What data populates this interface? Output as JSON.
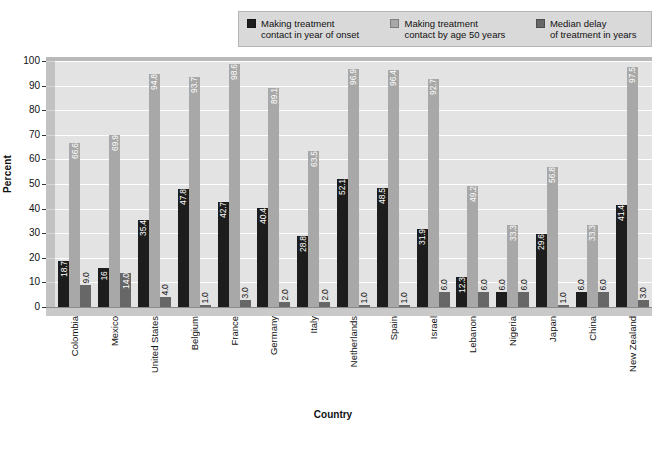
{
  "legend": {
    "items": [
      {
        "label": "Making treatment\ncontact in year of onset",
        "color": "#1d1d1d",
        "name": "series-onset"
      },
      {
        "label": "Making treatment\ncontact by age 50 years",
        "color": "#a8a8a8",
        "name": "series-by-age-50"
      },
      {
        "label": "Median delay\nof treatment in years",
        "color": "#676767",
        "name": "series-median-delay"
      }
    ]
  },
  "chart_data": {
    "type": "bar",
    "title": "",
    "xlabel": "Country",
    "ylabel": "Percent",
    "ylim": [
      0,
      100
    ],
    "yticks": [
      0,
      10,
      20,
      30,
      40,
      50,
      60,
      70,
      80,
      90,
      100
    ],
    "grid": true,
    "legend_position": "top",
    "categories": [
      "Colombia",
      "Mexico",
      "United States",
      "Belgium",
      "France",
      "Germany",
      "Italy",
      "Netherlands",
      "Spain",
      "Israel",
      "Lebanon",
      "Nigeria",
      "Japan",
      "China",
      "New Zealand"
    ],
    "series": [
      {
        "name": "Making treatment contact in year of onset",
        "color": "#1d1d1d",
        "values": [
          18.7,
          16,
          35.4,
          47.8,
          42.7,
          40.4,
          28.8,
          52.1,
          48.5,
          31.9,
          12.3,
          6.0,
          29.6,
          6.0,
          41.4
        ],
        "labels": [
          "18.7",
          "16",
          "35.4",
          "47.8",
          "42.7",
          "40.4",
          "28.8",
          "52.1",
          "48.5",
          "31.9",
          "12.3",
          "6.0",
          "29.6",
          "6.0",
          "41.4"
        ]
      },
      {
        "name": "Making treatment contact by age 50 years",
        "color": "#a8a8a8",
        "values": [
          66.6,
          69.9,
          94.8,
          93.7,
          98.6,
          89.1,
          63.5,
          96.9,
          96.4,
          92.7,
          49.2,
          33.3,
          56.8,
          33.3,
          97.5
        ],
        "labels": [
          "66.6",
          "69.9",
          "94.8",
          "93.7",
          "98.6",
          "89.1",
          "63.5",
          "96.9",
          "96.4",
          "92.7",
          "49.2",
          "33.3",
          "56.8",
          "33.3",
          "97.5"
        ]
      },
      {
        "name": "Median delay of treatment in years",
        "color": "#676767",
        "values": [
          9.0,
          14.0,
          4.0,
          1.0,
          3.0,
          2.0,
          2.0,
          1.0,
          1.0,
          6.0,
          6.0,
          6.0,
          1.0,
          6.0,
          3.0
        ],
        "labels": [
          "9.0",
          "14.0",
          "4.0",
          "1.0",
          "3.0",
          "2.0",
          "2.0",
          "1.0",
          "1.0",
          "6.0",
          "6.0",
          "6.0",
          "1.0",
          "6.0",
          "3.0"
        ]
      }
    ]
  }
}
